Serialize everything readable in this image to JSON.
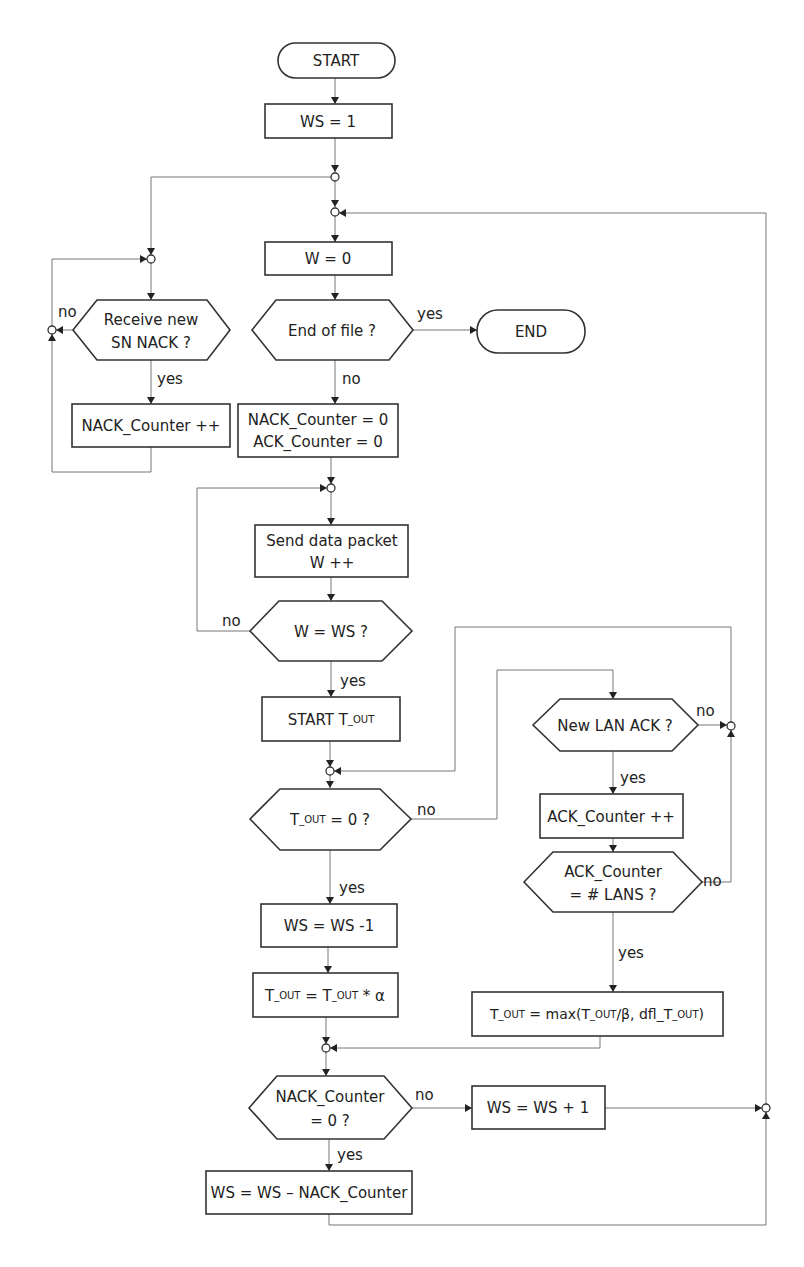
{
  "nodes": {
    "start": "START",
    "ws_init": "WS = 1",
    "w_reset": "W = 0",
    "eof_q": "End of file ?",
    "end": "END",
    "rx_nack_q_line1": "Receive new",
    "rx_nack_q_line2": "SN NACK ?",
    "nack_inc": "NACK_Counter ++",
    "reset_line1": "NACK_Counter = 0",
    "reset_line2": "ACK_Counter = 0",
    "send_line1": "Send data packet",
    "send_line2": "W ++",
    "w_eq_ws_q": "W = WS ?",
    "start_tout_a": "START  T",
    "start_tout_sub": "_OUT",
    "tout_zero_a": "T",
    "tout_zero_sub": "_OUT",
    "tout_zero_b": " = 0 ?",
    "ws_dec": "WS = WS -1",
    "tout_mul_a": "T",
    "tout_mul_sub1": "_OUT",
    "tout_mul_b": " = T",
    "tout_mul_sub2": "_OUT",
    "tout_mul_c": " * α",
    "new_lan_ack_q": "New LAN ACK ?",
    "ack_inc": "ACK_Counter ++",
    "ack_eq_q_line1": "ACK_Counter",
    "ack_eq_q_line2": "= # LANS ?",
    "tout_max_a": "T",
    "tout_max_sub1": "_OUT",
    "tout_max_b": " = max(T",
    "tout_max_sub2": "_OUT",
    "tout_max_c": "/β, dfl_T",
    "tout_max_sub3": "_OUT",
    "tout_max_d": ")",
    "nack_zero_q_line1": "NACK_Counter",
    "nack_zero_q_line2": "= 0 ?",
    "ws_inc": "WS = WS + 1",
    "ws_sub_nack": "WS = WS – NACK_Counter"
  },
  "edge_labels": {
    "yes": "yes",
    "no": "no"
  },
  "colors": {
    "stroke": "#333333",
    "connector": "#777777",
    "background": "#ffffff"
  }
}
